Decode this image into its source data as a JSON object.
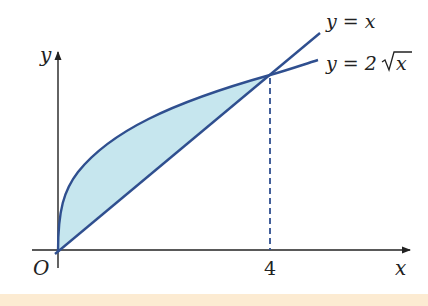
{
  "diagram": {
    "type": "area-between-curves",
    "axes": {
      "x_label": "x",
      "y_label": "y",
      "origin_label": "O",
      "x_tick_label": "4"
    },
    "curves": [
      {
        "name": "line",
        "label": "y = x",
        "color": "#2f4f8f"
      },
      {
        "name": "root",
        "label": "y = 2√x",
        "label_prefix": "y = 2",
        "label_radicand": "x",
        "color": "#2f4f8f"
      }
    ],
    "intersection": {
      "x": 4,
      "y": 4
    },
    "shaded_region": {
      "from_x": 0,
      "to_x": 4,
      "fill": "#c6e6ee"
    },
    "dashed_line_color": "#2f4f8f",
    "footer_color": "#fcebd2"
  }
}
